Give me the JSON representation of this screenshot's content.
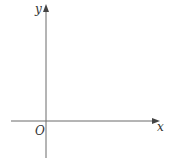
{
  "diagram": {
    "type": "cartesian-axes",
    "x_axis_label": "x",
    "y_axis_label": "y",
    "origin_label": "O",
    "axis_color": "#6b6b6b",
    "label_color": "#333333"
  }
}
